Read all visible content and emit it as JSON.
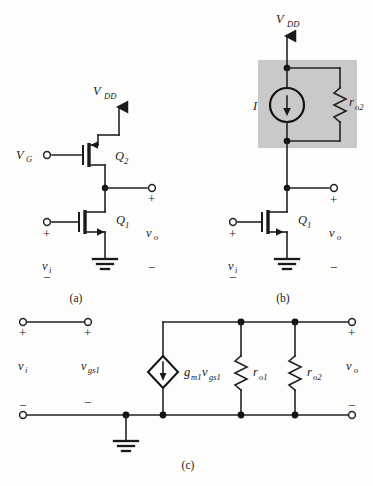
{
  "figure": {
    "background_color": "#fdfdfb",
    "line_color": "#1a1a1a",
    "shade_color": "#c9c9c9"
  },
  "subfigures": [
    {
      "id": "a",
      "caption": "(a)"
    },
    {
      "id": "b",
      "caption": "(b)"
    },
    {
      "id": "c",
      "caption": "(c)"
    }
  ],
  "circuit_a": {
    "supply_label": "V",
    "supply_sub": "DD",
    "gate_bias_label": "V",
    "gate_bias_sub": "G",
    "transistor_top": {
      "label": "Q",
      "sub": "2",
      "type": "pmos"
    },
    "transistor_bottom": {
      "label": "Q",
      "sub": "1",
      "type": "nmos"
    },
    "input_label": "v",
    "input_sub": "i",
    "output_label": "v",
    "output_sub": "o",
    "plus_sign": "+",
    "minus_sign": "−",
    "ground": "ground-symbol"
  },
  "circuit_b": {
    "supply_label": "V",
    "supply_sub": "DD",
    "current_source_label": "I",
    "resistor_label": "r",
    "resistor_sub": "o2",
    "transistor": {
      "label": "Q",
      "sub": "1",
      "type": "nmos"
    },
    "input_label": "v",
    "input_sub": "i",
    "output_label": "v",
    "output_sub": "o",
    "plus_sign": "+",
    "minus_sign": "−",
    "shaded_region": "current-source-load-box",
    "ground": "ground-symbol"
  },
  "circuit_c": {
    "input_label": "v",
    "input_sub": "i",
    "vgs_label": "v",
    "vgs_sub": "gs1",
    "dependent_source_label_g": "g",
    "dependent_source_sub_m1": "m1",
    "dependent_source_label_v": "v",
    "dependent_source_sub_gs1": "gs1",
    "resistor1_label": "r",
    "resistor1_sub": "o1",
    "resistor2_label": "r",
    "resistor2_sub": "o2",
    "output_label": "v",
    "output_sub": "o",
    "plus_sign": "+",
    "minus_sign": "−",
    "ground": "ground-symbol"
  }
}
